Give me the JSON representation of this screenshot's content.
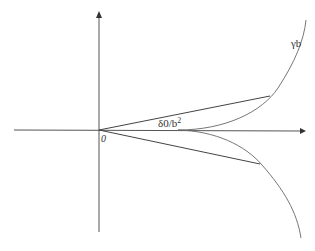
{
  "diagram": {
    "labels": {
      "origin": "0",
      "curve": "γb",
      "point_prefix": "δ0/b",
      "point_exponent": "2"
    },
    "colors": {
      "axis": "#555555",
      "curve": "#666666",
      "chord": "#444444",
      "background": "#ffffff"
    },
    "elements": {
      "x_axis": {
        "from": [
          14,
          130
        ],
        "to": [
          305,
          131
        ],
        "arrow": "right"
      },
      "y_axis": {
        "from": [
          99,
          232
        ],
        "to": [
          99,
          12
        ],
        "arrow": "up"
      },
      "upper_chord": {
        "from": [
          99,
          130
        ],
        "to": [
          270,
          96
        ]
      },
      "lower_chord": {
        "from": [
          99,
          130
        ],
        "to": [
          260,
          164
        ]
      },
      "curve_vertex": [
        178,
        130
      ]
    }
  }
}
